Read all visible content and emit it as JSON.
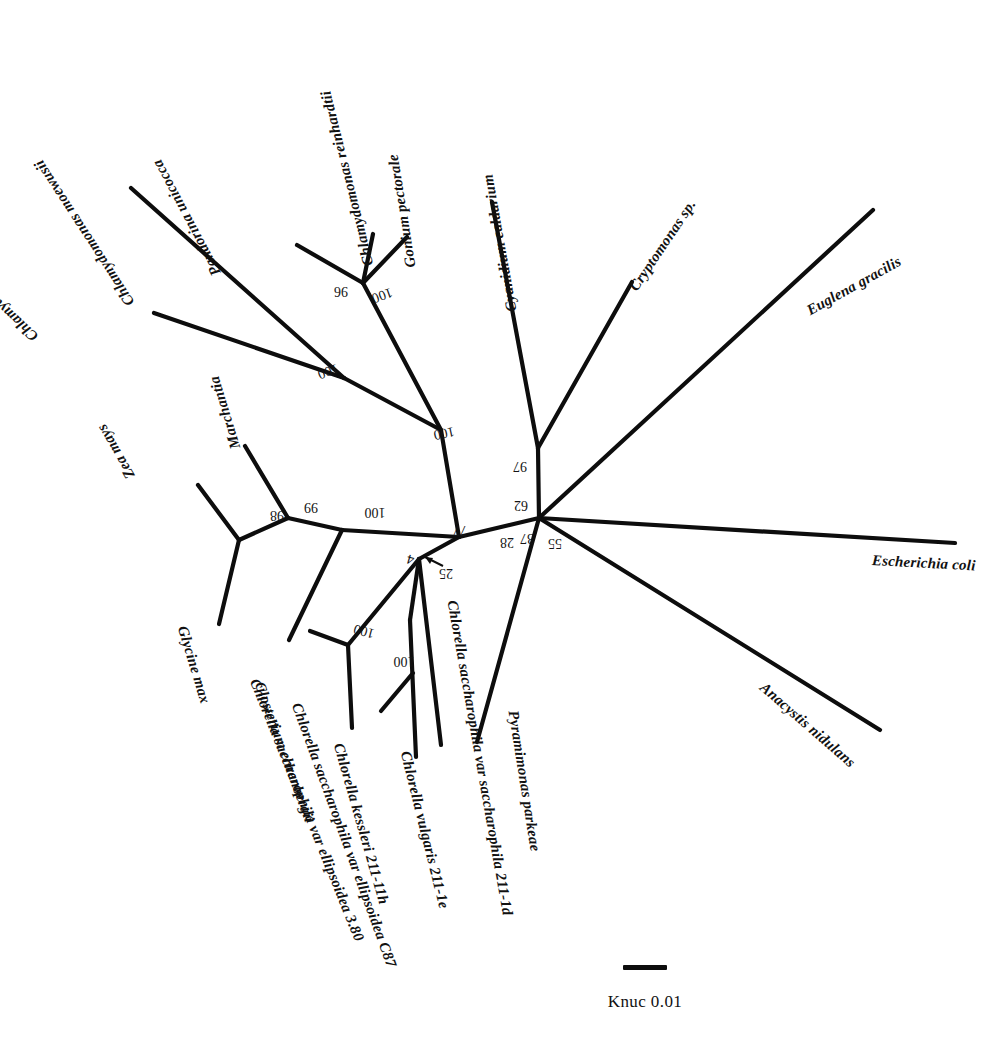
{
  "figure": {
    "kind": "unrooted-phylogenetic-tree",
    "background_color": "#ffffff",
    "line_color": "#0d0d0d"
  },
  "scale": {
    "label": "Knuc 0.01",
    "bar_value": 0.01,
    "bar_unit": "Knuc"
  },
  "taxa": [
    {
      "id": "chlamydomonas-parkeae",
      "label": "Chlamydomonas parkeae",
      "x": 36,
      "y": 330,
      "rotate": -137
    },
    {
      "id": "chlamydomonas-moewusii",
      "label": "Chlamydomonas moewusii",
      "x": 131,
      "y": 296,
      "rotate": -123
    },
    {
      "id": "pandorina-unicocca",
      "label": "Pandorina unicocca",
      "x": 217,
      "y": 266,
      "rotate": -118
    },
    {
      "id": "chlamydomonas-reinhardtii",
      "label": "Chlamydomonas reinhardtii",
      "x": 369,
      "y": 257,
      "rotate": -104
    },
    {
      "id": "gonium-pectorale",
      "label": "Gonium pectorale",
      "x": 411,
      "y": 259,
      "rotate": -99
    },
    {
      "id": "cyanidium-caldarium",
      "label": "Cyanidium caldarium",
      "x": 512,
      "y": 303,
      "rotate": -100
    },
    {
      "id": "cryptomonas-sp",
      "label": "Cryptomonas sp.",
      "x": 633,
      "y": 281,
      "rotate": -56
    },
    {
      "id": "euglena-gracilis",
      "label": "Euglena gracilis",
      "x": 808,
      "y": 303,
      "rotate": -29
    },
    {
      "id": "escherichia-coli",
      "label": "Escherichia coli",
      "x": 872,
      "y": 552,
      "rotate": 3
    },
    {
      "id": "anacystis-nidulans",
      "label": "Anacystis nidulans",
      "x": 762,
      "y": 677,
      "rotate": 41
    },
    {
      "id": "pyramimonas-parkeae",
      "label": "Pyramimonas parkeae",
      "x": 513,
      "y": 702,
      "rotate": 81
    },
    {
      "id": "chlorella-sacch-sacch-211-1d",
      "label": "Chlorella saccharophila var saccharophila 211-1d",
      "x": 452,
      "y": 592,
      "rotate": 80
    },
    {
      "id": "chlorella-vulgaris-211-1e",
      "label": "Chlorella vulgaris 211-1e",
      "x": 405,
      "y": 743,
      "rotate": 76
    },
    {
      "id": "chlorella-kessleri-211-11h",
      "label": "Chlorella kessleri 211-11h",
      "x": 338,
      "y": 735,
      "rotate": 74
    },
    {
      "id": "chlorella-sacch-ellips-c87",
      "label": "Chlorella saccharophila var ellipsoidea C87",
      "x": 296,
      "y": 695,
      "rotate": 70
    },
    {
      "id": "chlorella-sacch-ellips-380",
      "label": "Chlorella saccharophila var ellipsoidea 3.80",
      "x": 254,
      "y": 671,
      "rotate": 68
    },
    {
      "id": "closterium-ehrenbergii",
      "label": "Closterium ehrenbergii",
      "x": 259,
      "y": 674,
      "rotate": 70
    },
    {
      "id": "glycine-max",
      "label": "Glycine max",
      "x": 182,
      "y": 618,
      "rotate": 73
    },
    {
      "id": "zea-mays",
      "label": "Zea mays",
      "x": 131,
      "y": 469,
      "rotate": -120
    },
    {
      "id": "marchantia",
      "label": "Marchantia",
      "x": 236,
      "y": 440,
      "rotate": -107
    }
  ],
  "bootstrap_values": [
    {
      "id": "boot-gonium-reinhardtii",
      "value": "96",
      "x": 341,
      "y": 291,
      "rotate": 180
    },
    {
      "id": "boot-volvocales",
      "value": "100",
      "x": 382,
      "y": 295,
      "rotate": 160
    },
    {
      "id": "boot-chlamy-clade",
      "value": "100",
      "x": 328,
      "y": 371,
      "rotate": 160
    },
    {
      "id": "boot-chlorophyte-stem",
      "value": "100",
      "x": 444,
      "y": 433,
      "rotate": 168
    },
    {
      "id": "boot-red-crypto",
      "value": "97",
      "x": 520,
      "y": 466,
      "rotate": 180
    },
    {
      "id": "boot-plastid-core",
      "value": "62",
      "x": 521,
      "y": 505,
      "rotate": 180
    },
    {
      "id": "boot-chlorella-stem",
      "value": "77",
      "x": 460,
      "y": 530,
      "rotate": 180
    },
    {
      "id": "boot-28",
      "value": "28",
      "x": 507,
      "y": 542,
      "rotate": 180
    },
    {
      "id": "boot-37",
      "value": "37",
      "x": 527,
      "y": 538,
      "rotate": 180
    },
    {
      "id": "boot-55",
      "value": "55",
      "x": 555,
      "y": 543,
      "rotate": 180
    },
    {
      "id": "boot-74",
      "value": "74",
      "x": 414,
      "y": 560,
      "rotate": 196
    },
    {
      "id": "boot-25",
      "value": "25",
      "x": 446,
      "y": 573,
      "rotate": 180
    },
    {
      "id": "boot-streptophyte",
      "value": "100",
      "x": 375,
      "y": 512,
      "rotate": 180
    },
    {
      "id": "boot-land-plants",
      "value": "99",
      "x": 311,
      "y": 507,
      "rotate": 180
    },
    {
      "id": "boot-seed-plants",
      "value": "98",
      "x": 277,
      "y": 515,
      "rotate": 180
    },
    {
      "id": "boot-chlorella-a",
      "value": "100",
      "x": 364,
      "y": 631,
      "rotate": 195
    },
    {
      "id": "boot-chlorella-b",
      "value": "100",
      "x": 404,
      "y": 661,
      "rotate": 180
    }
  ],
  "branches": [
    {
      "id": "hub-to-crypto-node",
      "x1": 539,
      "y1": 518,
      "x2": 538,
      "y2": 448
    },
    {
      "id": "cyanidium-branch",
      "x1": 538,
      "y1": 448,
      "x2": 492,
      "y2": 202
    },
    {
      "id": "cryptomonas-branch",
      "x1": 538,
      "y1": 448,
      "x2": 632,
      "y2": 282
    },
    {
      "id": "hub-to-euglena",
      "x1": 539,
      "y1": 518,
      "x2": 873,
      "y2": 210
    },
    {
      "id": "hub-to-ecoli",
      "x1": 539,
      "y1": 518,
      "x2": 955,
      "y2": 543
    },
    {
      "id": "hub-to-anacystis",
      "x1": 539,
      "y1": 518,
      "x2": 880,
      "y2": 730
    },
    {
      "id": "hub-to-pyramimonas",
      "x1": 539,
      "y1": 518,
      "x2": 477,
      "y2": 742
    },
    {
      "id": "hub-to-green-node",
      "x1": 539,
      "y1": 518,
      "x2": 459,
      "y2": 537
    },
    {
      "id": "green-to-chloro-node",
      "x1": 459,
      "y1": 537,
      "x2": 419,
      "y2": 559
    },
    {
      "id": "green-to-strept-node",
      "x1": 459,
      "y1": 537,
      "x2": 342,
      "y2": 530
    },
    {
      "id": "chloro-node-to-211-1d",
      "x1": 419,
      "y1": 559,
      "x2": 441,
      "y2": 745
    },
    {
      "id": "chloro-node-to-sub",
      "x1": 419,
      "y1": 559,
      "x2": 410,
      "y2": 620
    },
    {
      "id": "sub-to-vulgaris-node",
      "x1": 410,
      "y1": 620,
      "x2": 416,
      "y2": 757
    },
    {
      "id": "vulgaris-node-branch",
      "x1": 413,
      "y1": 673,
      "x2": 381,
      "y2": 711
    },
    {
      "id": "chloro-sub-to-kess-node",
      "x1": 419,
      "y1": 559,
      "x2": 348,
      "y2": 645
    },
    {
      "id": "kess-node-to-c87",
      "x1": 348,
      "y1": 645,
      "x2": 310,
      "y2": 631
    },
    {
      "id": "kess-node-to-kessleri",
      "x1": 348,
      "y1": 645,
      "x2": 352,
      "y2": 728
    },
    {
      "id": "strept-to-closterium",
      "x1": 342,
      "y1": 530,
      "x2": 289,
      "y2": 640
    },
    {
      "id": "strept-to-plant-node",
      "x1": 342,
      "y1": 530,
      "x2": 288,
      "y2": 518
    },
    {
      "id": "plant-to-marchantia",
      "x1": 288,
      "y1": 518,
      "x2": 245,
      "y2": 446
    },
    {
      "id": "plant-to-seed-node",
      "x1": 288,
      "y1": 518,
      "x2": 239,
      "y2": 540
    },
    {
      "id": "seed-to-zeamays",
      "x1": 239,
      "y1": 540,
      "x2": 198,
      "y2": 485
    },
    {
      "id": "seed-to-glycine",
      "x1": 239,
      "y1": 540,
      "x2": 219,
      "y2": 624
    },
    {
      "id": "chloro-stem-upward",
      "x1": 459,
      "y1": 537,
      "x2": 441,
      "y2": 430
    },
    {
      "id": "upnode-to-chlamy-node",
      "x1": 441,
      "y1": 430,
      "x2": 344,
      "y2": 378
    },
    {
      "id": "chlamy-to-parkeae",
      "x1": 344,
      "y1": 378,
      "x2": 154,
      "y2": 313
    },
    {
      "id": "chlamy-to-moewusii",
      "x1": 344,
      "y1": 378,
      "x2": 131,
      "y2": 188
    },
    {
      "id": "upnode-to-volvo-node",
      "x1": 441,
      "y1": 430,
      "x2": 363,
      "y2": 283
    },
    {
      "id": "volvo-to-pandorina",
      "x1": 363,
      "y1": 283,
      "x2": 297,
      "y2": 245
    },
    {
      "id": "volvo-to-reinhardtii",
      "x1": 363,
      "y1": 283,
      "x2": 373,
      "y2": 234
    },
    {
      "id": "volvo-to-gonium",
      "x1": 363,
      "y1": 283,
      "x2": 407,
      "y2": 237
    }
  ]
}
